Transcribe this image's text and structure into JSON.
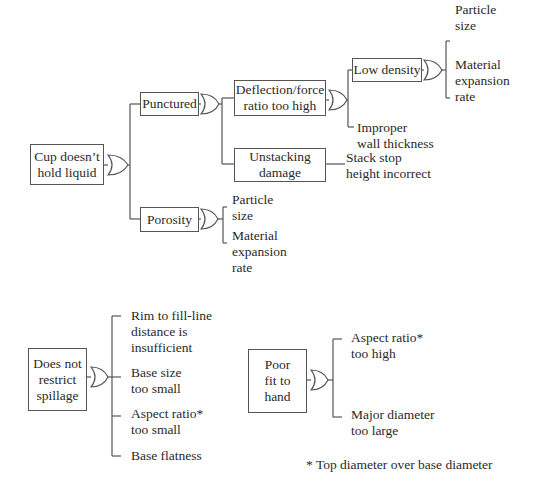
{
  "diagram": {
    "type": "fault-tree",
    "trees": [
      {
        "root": "Cup doesn't hold liquid",
        "gate": "OR",
        "children": [
          {
            "label": "Punctured",
            "gate": "OR",
            "children": [
              {
                "label": "Deflection/force ratio too high",
                "gate": "OR",
                "children": [
                  {
                    "label": "Low density",
                    "gate": "OR",
                    "causes": [
                      "Particle size",
                      "Material expansion rate"
                    ]
                  },
                  {
                    "label": "Improper wall thickness"
                  }
                ]
              },
              {
                "label": "Unstacking damage",
                "causes": [
                  "Stack stop height incorrect"
                ]
              }
            ]
          },
          {
            "label": "Porosity",
            "gate": "OR",
            "causes": [
              "Particle size",
              "Material expansion rate"
            ]
          }
        ]
      },
      {
        "root": "Does not restrict spillage",
        "gate": "OR",
        "causes": [
          "Rim to fill-line distance is insufficient",
          "Base size too small",
          "Aspect ratio* too small",
          "Base flatness"
        ]
      },
      {
        "root": "Poor fit to hand",
        "gate": "OR",
        "causes": [
          "Aspect ratio* too high",
          "Major diameter too large"
        ]
      }
    ]
  },
  "labels": {
    "cup": "Cup doesn’t\nhold liquid",
    "punctured": "Punctured",
    "porosity": "Porosity",
    "deflection": "Deflection/force\nratio too high",
    "unstacking": "Unstacking\ndamage",
    "low_density": "Low density",
    "stack_stop": "Stack stop\nheight incorrect",
    "improper_wall": "Improper\nwall thickness",
    "ld_particle": "Particle\nsize",
    "ld_material": "Material\nexpansion\nrate",
    "por_particle": "Particle\nsize",
    "por_material": "Material\nexpansion\nrate",
    "spillage": "Does not\nrestrict\nspillage",
    "rim": "Rim to fill-line\ndistance is\ninsufficient",
    "base_size": "Base size\ntoo small",
    "aspect_small": "Aspect ratio*\ntoo small",
    "base_flat": "Base flatness",
    "poor_fit": "Poor\nfit to\nhand",
    "aspect_high": "Aspect ratio*\ntoo high",
    "major_dia": "Major diameter\ntoo large",
    "footnote": "* Top diameter over base diameter"
  }
}
